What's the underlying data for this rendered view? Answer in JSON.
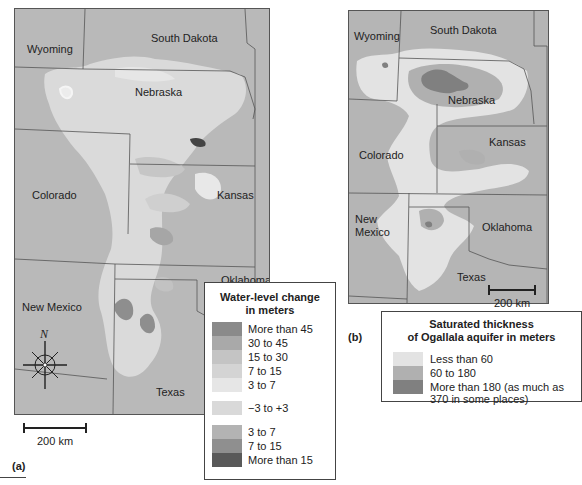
{
  "panel_a": {
    "tag": "(a)",
    "states": {
      "wyoming": "Wyoming",
      "south_dakota": "South Dakota",
      "nebraska": "Nebraska",
      "colorado": "Colorado",
      "kansas": "Kansas",
      "oklahoma": "Oklahoma",
      "new_mexico": "New Mexico",
      "texas": "Texas"
    },
    "compass_label": "N",
    "scale_label": "200 km",
    "legend": {
      "title_line1": "Water-level change",
      "title_line2": "in meters",
      "items": [
        {
          "label": "More than 45",
          "color": "#8a8a8a"
        },
        {
          "label": "30 to 45",
          "color": "#a9a9a9"
        },
        {
          "label": "15 to 30",
          "color": "#c4c4c4"
        },
        {
          "label": "7 to 15",
          "color": "#d4d4d4"
        },
        {
          "label": "3 to 7",
          "color": "#e6e6e6"
        },
        {
          "label": "−3 to +3",
          "color": "#d9d9d9"
        },
        {
          "label": "3 to 7",
          "color": "#b3b3b3"
        },
        {
          "label": "7 to 15",
          "color": "#8f8f8f"
        },
        {
          "label": "More than 15",
          "color": "#595959"
        }
      ]
    }
  },
  "panel_b": {
    "tag": "(b)",
    "states": {
      "wyoming": "Wyoming",
      "south_dakota": "South Dakota",
      "nebraska": "Nebraska",
      "colorado": "Colorado",
      "kansas": "Kansas",
      "oklahoma": "Oklahoma",
      "new_mexico_1": "New",
      "new_mexico_2": "Mexico",
      "texas": "Texas"
    },
    "scale_label": "200 km",
    "legend": {
      "title_line1": "Saturated thickness",
      "title_line2": "of Ogallala aquifer in meters",
      "items": [
        {
          "label": "Less than 60",
          "color": "#e3e3e3"
        },
        {
          "label": "60 to 180",
          "color": "#b0b0b0"
        },
        {
          "label": "More than 180 (as much as",
          "label2": "370 in some places)",
          "color": "#808080"
        }
      ]
    }
  }
}
